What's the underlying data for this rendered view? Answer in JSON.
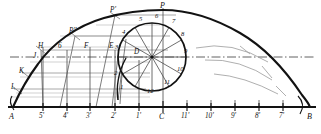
{
  "drawing": {
    "title": "Cycloid construction",
    "type": "technical-line-drawing",
    "stroke_color": "#121212",
    "thin_color": "#6a6a6a",
    "faint_color": "#b0b0b0",
    "background": "#ffffff",
    "width": 321,
    "height": 134
  },
  "baseline": {
    "label_left": "A",
    "label_right": "B",
    "y": 107,
    "x_start": 8,
    "x_end": 316,
    "ticks": [
      {
        "label": "A",
        "x": 13
      },
      {
        "label": "5'",
        "x": 43
      },
      {
        "label": "4'",
        "x": 67
      },
      {
        "label": "3'",
        "x": 90
      },
      {
        "label": "2'",
        "x": 115
      },
      {
        "label": "1'",
        "x": 139
      },
      {
        "label": "C",
        "x": 163
      },
      {
        "label": "11'",
        "x": 187
      },
      {
        "label": "10'",
        "x": 211
      },
      {
        "label": "9'",
        "x": 235
      },
      {
        "label": "8'",
        "x": 259
      },
      {
        "label": "7'",
        "x": 283
      },
      {
        "label": "B",
        "x": 310
      }
    ]
  },
  "rolling_circle": {
    "center_label": "",
    "center_x": 152,
    "center_y": 57,
    "radius": 34,
    "division_count": 12,
    "divisions": [
      {
        "label": "1",
        "x": 124,
        "y": 88
      },
      {
        "label": "2",
        "x": 118,
        "y": 74
      },
      {
        "label": "3",
        "x": 118,
        "y": 56
      },
      {
        "label": "4",
        "x": 126,
        "y": 39
      },
      {
        "label": "5",
        "x": 142,
        "y": 25
      },
      {
        "label": "6",
        "x": 158,
        "y": 22
      },
      {
        "label": "7",
        "x": 175,
        "y": 27
      },
      {
        "label": "8",
        "x": 184,
        "y": 40
      },
      {
        "label": "9",
        "x": 187,
        "y": 57
      },
      {
        "label": "10",
        "x": 181,
        "y": 74
      },
      {
        "label": "11",
        "x": 168,
        "y": 86
      },
      {
        "label": "12",
        "x": 152,
        "y": 92
      }
    ]
  },
  "points": {
    "apex": "P",
    "generated": [
      {
        "label": "P'",
        "x": 115,
        "y": 15
      },
      {
        "label": "P''",
        "x": 75,
        "y": 36
      }
    ],
    "left_curve": [
      {
        "label": "H",
        "x": 41,
        "y": 50
      },
      {
        "label": "J",
        "x": 38,
        "y": 58
      },
      {
        "label": "K",
        "x": 24,
        "y": 73
      },
      {
        "label": "L",
        "x": 15,
        "y": 89
      }
    ],
    "centerline_marks": [
      {
        "label": "6",
        "x": 61,
        "y": 50
      },
      {
        "label": "F",
        "x": 87,
        "y": 50
      },
      {
        "label": "E",
        "x": 112,
        "y": 50
      },
      {
        "label": "D",
        "x": 137,
        "y": 55
      }
    ]
  },
  "guides": {
    "centerline_y": 57,
    "centerline_style": "dash-dot",
    "vertical_axis_x": 163
  }
}
